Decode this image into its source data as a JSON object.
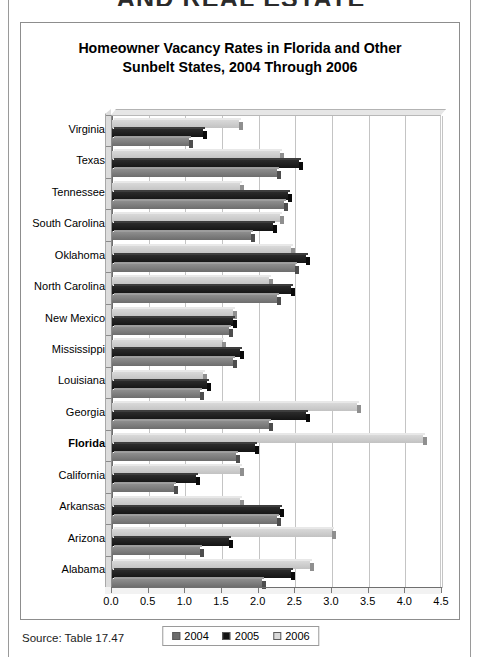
{
  "page": {
    "running_head": "AND REAL ESTATE",
    "source_note": "Source: Table 17.47"
  },
  "chart_data": {
    "type": "bar",
    "orientation": "horizontal",
    "title": "Homeowner Vacancy Rates in Florida and Other Sunbelt States, 2004 Through 2006",
    "title_line1": "Homeowner Vacancy Rates in Florida and Other",
    "title_line2": "Sunbelt States, 2004 Through 2006",
    "xlabel": "",
    "ylabel": "",
    "xlim": [
      0.0,
      4.5
    ],
    "xticks": [
      "0.0",
      "0.5",
      "1.0",
      "1.5",
      "2.0",
      "2.5",
      "3.0",
      "3.5",
      "4.0",
      "4.5"
    ],
    "grid": true,
    "legend_position": "bottom",
    "highlight_category": "Florida",
    "categories": [
      "Virginia",
      "Texas",
      "Tennessee",
      "South Carolina",
      "Oklahoma",
      "North Carolina",
      "New Mexico",
      "Mississippi",
      "Louisiana",
      "Georgia",
      "Florida",
      "California",
      "Arkansas",
      "Arizona",
      "Alabama"
    ],
    "series": [
      {
        "name": "2004",
        "color": "#6d6d6d",
        "values": [
          1.1,
          2.3,
          2.4,
          1.95,
          2.55,
          2.3,
          1.65,
          1.7,
          1.25,
          2.2,
          1.75,
          0.9,
          2.3,
          1.25,
          2.1
        ]
      },
      {
        "name": "2005",
        "color": "#141414",
        "values": [
          1.3,
          2.6,
          2.45,
          2.25,
          2.7,
          2.5,
          1.7,
          1.8,
          1.35,
          2.7,
          2.0,
          1.2,
          2.35,
          1.65,
          2.5
        ]
      },
      {
        "name": "2006",
        "color": "#d9d9d9",
        "values": [
          1.78,
          2.35,
          1.8,
          2.35,
          2.5,
          2.2,
          1.7,
          1.55,
          1.3,
          3.4,
          4.3,
          1.8,
          1.8,
          3.05,
          2.75
        ]
      }
    ],
    "legend": [
      "2004",
      "2005",
      "2006"
    ]
  }
}
